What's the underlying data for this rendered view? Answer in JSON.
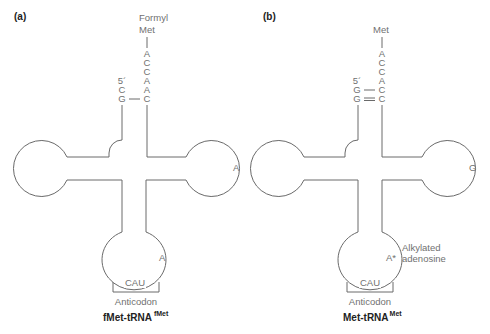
{
  "figure": {
    "stroke_color": "#6a6a6a",
    "text_color": "#707070",
    "title_color": "#222222"
  },
  "panels": [
    {
      "id": "a",
      "panel_label": "(a)",
      "offset_x": 0,
      "amino_acid_label": [
        "Formyl",
        "Met"
      ],
      "acceptor_3prime": [
        "A",
        "C",
        "C",
        "A",
        "A",
        "C"
      ],
      "five_prime_label": "5´",
      "acceptor_5prime": [
        "C",
        "G"
      ],
      "pairs": [
        {
          "left": "C",
          "right": "A",
          "bond": "none"
        },
        {
          "left": "G",
          "right": "C",
          "bond": "single"
        }
      ],
      "t_loop_base": "A",
      "anticodon_loop_base": "A",
      "anticodon": "CAU",
      "anticodon_label": "Anticodon",
      "annotation": [],
      "title_main": "fMet-tRNA",
      "title_sup": "fMet"
    },
    {
      "id": "b",
      "panel_label": "(b)",
      "offset_x": 236,
      "amino_acid_label": [
        "Met"
      ],
      "acceptor_3prime": [
        "A",
        "C",
        "C",
        "A",
        "C",
        "C"
      ],
      "five_prime_label": "5´",
      "acceptor_5prime": [
        "G",
        "G"
      ],
      "pairs": [
        {
          "left": "G",
          "right": "C",
          "bond": "single"
        },
        {
          "left": "G",
          "right": "C",
          "bond": "double"
        }
      ],
      "t_loop_base": "G",
      "anticodon_loop_base": "A*",
      "anticodon": "CAU",
      "anticodon_label": "Anticodon",
      "annotation": [
        "Alkylated",
        "adenosine"
      ],
      "title_main": "Met-tRNA",
      "title_sup": "Met"
    }
  ]
}
